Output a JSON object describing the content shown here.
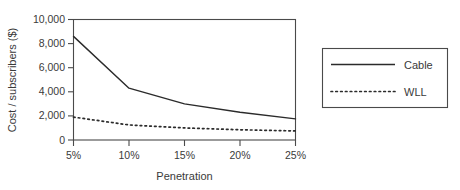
{
  "chart_data": {
    "type": "line",
    "title": "",
    "xlabel": "Penetration",
    "ylabel": "Cost / subscribers ($)",
    "categories": [
      "5%",
      "10%",
      "15%",
      "20%",
      "25%"
    ],
    "x": [
      5,
      10,
      15,
      20,
      25
    ],
    "xlim": [
      5,
      25
    ],
    "ylim": [
      0,
      10000
    ],
    "yticks": [
      0,
      2000,
      4000,
      6000,
      8000,
      10000
    ],
    "ytick_labels": [
      "0",
      "2,000",
      "4,000",
      "6,000",
      "8,000",
      "10,000"
    ],
    "xtick_labels": [
      "5%",
      "10%",
      "15%",
      "20%",
      "25%"
    ],
    "grid": false,
    "legend_position": "right-outside",
    "series": [
      {
        "name": "Cable",
        "style": "solid",
        "color": "#2b2b2b",
        "values": [
          8600,
          4300,
          3000,
          2300,
          1750
        ]
      },
      {
        "name": "WLL",
        "style": "dotted",
        "color": "#2b2b2b",
        "values": [
          1900,
          1250,
          1000,
          850,
          750
        ]
      }
    ],
    "legend": [
      {
        "label": "Cable",
        "style": "solid"
      },
      {
        "label": "WLL",
        "style": "dotted"
      }
    ]
  },
  "colors": {
    "background": "#ffffff",
    "axis": "#4a4a4a",
    "ink": "#2b2b2b",
    "text": "#3a3a3a"
  }
}
